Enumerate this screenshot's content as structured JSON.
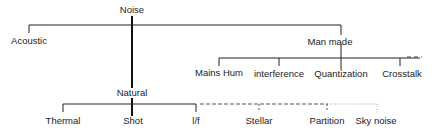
{
  "diagram": {
    "title": "Noise",
    "root": {
      "label": "Noise",
      "children": [
        {
          "label": "Acoustic"
        },
        {
          "label": "Natural",
          "children": [
            {
              "label": "Thermal",
              "link": "solid"
            },
            {
              "label": "Shot",
              "link": "solid"
            },
            {
              "label": "l/f",
              "link": "solid"
            },
            {
              "label": "Stellar",
              "link": "dashed"
            },
            {
              "label": "Partition",
              "link": "dashed"
            },
            {
              "label": "Sky noise",
              "link": "dotted"
            }
          ]
        },
        {
          "label": "Man made",
          "children": [
            {
              "label": "Mains Hum",
              "link": "solid"
            },
            {
              "label": "interference",
              "link": "solid"
            },
            {
              "label": "Quantization",
              "link": "solid"
            },
            {
              "label": "Crosstalk",
              "link": "solid"
            }
          ],
          "continuation": "dashed"
        }
      ]
    },
    "colors": {
      "line": "#222222",
      "dashed": "#555555",
      "dotted": "#999999",
      "text": "#222222"
    }
  }
}
